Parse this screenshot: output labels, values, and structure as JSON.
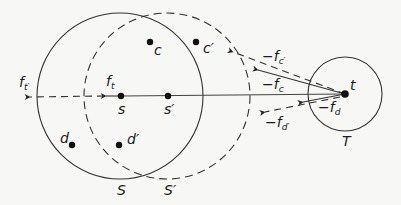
{
  "diagram": {
    "colors": {
      "stroke": "#333333",
      "background": "#f7f7f5",
      "text": "#1a1a1a"
    },
    "circles": [
      {
        "id": "S",
        "label": "S",
        "style": "solid"
      },
      {
        "id": "S_prime",
        "label": "S′",
        "style": "dashed"
      },
      {
        "id": "T",
        "label": "T",
        "style": "solid"
      }
    ],
    "points": [
      {
        "id": "s",
        "label": "s"
      },
      {
        "id": "s_prime",
        "label": "s′"
      },
      {
        "id": "t",
        "label": "t"
      },
      {
        "id": "c",
        "label": "c"
      },
      {
        "id": "c_prime",
        "label": "c′"
      },
      {
        "id": "d",
        "label": "d"
      },
      {
        "id": "d_prime",
        "label": "d′"
      }
    ],
    "vectors": {
      "f_t": {
        "base": "f",
        "sub": "t",
        "style": "solid"
      },
      "f_t_prime": {
        "base": "f",
        "sub": "t′",
        "style": "dashed"
      },
      "neg_f_c": {
        "base": "−f",
        "sub": "c",
        "style": "solid"
      },
      "neg_f_c_prime": {
        "base": "−f",
        "sub": "c′",
        "style": "dashed"
      },
      "neg_f_d": {
        "base": "−f",
        "sub": "d",
        "style": "solid"
      },
      "neg_f_d_prime": {
        "base": "−f",
        "sub": "d′",
        "style": "dashed"
      }
    }
  }
}
